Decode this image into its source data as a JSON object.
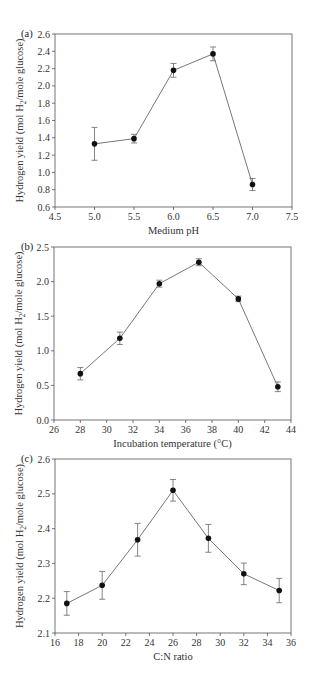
{
  "figure": {
    "panels": [
      "(a)",
      "(b)",
      "(c)"
    ]
  },
  "chart_data": [
    {
      "type": "line",
      "panel": "(a)",
      "title": "",
      "xlabel": "Medium pH",
      "ylabel": "Hydrogen yield (mol H2/mole glucose)",
      "xlim": [
        4.5,
        7.5
      ],
      "ylim": [
        0.6,
        2.6
      ],
      "xticks": [
        4.5,
        5.0,
        5.5,
        6.0,
        6.5,
        7.0,
        7.5
      ],
      "xtick_labels": [
        "4.5",
        "5.0",
        "5.5",
        "6.0",
        "6.5",
        "7.0",
        "7.5"
      ],
      "yticks": [
        0.6,
        0.8,
        1.0,
        1.2,
        1.4,
        1.6,
        1.8,
        2.0,
        2.2,
        2.4,
        2.6
      ],
      "ytick_labels": [
        "0.6",
        "0.8",
        "1.0",
        "1.2",
        "1.4",
        "1.6",
        "1.8",
        "2.0",
        "2.2",
        "2.4",
        "2.6"
      ],
      "grid": false,
      "legend": null,
      "x": [
        5.0,
        5.5,
        6.0,
        6.5,
        7.0
      ],
      "values": [
        1.33,
        1.39,
        2.18,
        2.37,
        0.86
      ],
      "error": [
        0.19,
        0.05,
        0.08,
        0.08,
        0.07
      ],
      "box": {
        "left": 55,
        "top": 34,
        "right": 292,
        "bottom": 207
      }
    },
    {
      "type": "line",
      "panel": "(b)",
      "title": "",
      "xlabel": "Incubation temperature (°C)",
      "ylabel": "Hydrogen yield (mol H2/mole glucose)",
      "xlim": [
        26,
        44
      ],
      "ylim": [
        0.0,
        2.5
      ],
      "xticks": [
        26,
        28,
        30,
        32,
        34,
        36,
        38,
        40,
        42,
        44
      ],
      "xtick_labels": [
        "26",
        "28",
        "30",
        "32",
        "34",
        "36",
        "38",
        "40",
        "42",
        "44"
      ],
      "yticks": [
        0.0,
        0.5,
        1.0,
        1.5,
        2.0,
        2.5
      ],
      "ytick_labels": [
        "0.0",
        "0.5",
        "1.0",
        "1.5",
        "2.0",
        "2.5"
      ],
      "grid": false,
      "legend": null,
      "x": [
        28,
        31,
        34,
        37,
        40,
        43
      ],
      "values": [
        0.67,
        1.18,
        1.97,
        2.28,
        1.75,
        0.48
      ],
      "error": [
        0.09,
        0.09,
        0.05,
        0.05,
        0.04,
        0.07
      ],
      "box": {
        "left": 54,
        "top": 247,
        "right": 291,
        "bottom": 420
      }
    },
    {
      "type": "line",
      "panel": "(c)",
      "title": "",
      "xlabel": "C:N ratio",
      "ylabel": "Hydrogen yield (mol H2/mole glucose)",
      "xlim": [
        16,
        36
      ],
      "ylim": [
        2.1,
        2.6
      ],
      "xticks": [
        16,
        18,
        20,
        22,
        24,
        26,
        28,
        30,
        32,
        34,
        36
      ],
      "xtick_labels": [
        "16",
        "18",
        "20",
        "22",
        "24",
        "26",
        "28",
        "30",
        "32",
        "34",
        "36"
      ],
      "yticks": [
        2.1,
        2.2,
        2.3,
        2.4,
        2.5,
        2.6
      ],
      "ytick_labels": [
        "2.1",
        "2.2",
        "2.3",
        "2.4",
        "2.5",
        "2.6"
      ],
      "grid": false,
      "legend": null,
      "x": [
        17,
        20,
        23,
        26,
        29,
        32,
        35
      ],
      "values": [
        2.185,
        2.237,
        2.368,
        2.51,
        2.372,
        2.27,
        2.222
      ],
      "error": [
        0.034,
        0.04,
        0.047,
        0.031,
        0.04,
        0.031,
        0.035
      ],
      "box": {
        "left": 55,
        "top": 459,
        "right": 291,
        "bottom": 633
      }
    }
  ]
}
